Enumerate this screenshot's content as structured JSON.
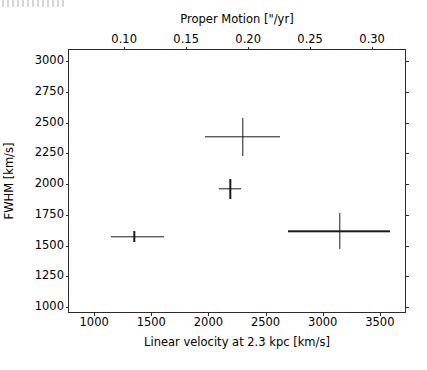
{
  "figure": {
    "width": 427,
    "height": 370,
    "background": "#ffffff",
    "foreground": "#000000",
    "marker_color": "#1a1a1a"
  },
  "chart_data": {
    "type": "scatter",
    "title": "",
    "xlabel": "Linear velocity at 2.3 kpc [km/s]",
    "ylabel": "FWHM [km/s]",
    "xlabel_top": "Proper Motion [\"/yr]",
    "grid": false,
    "legend": false,
    "xlim": [
      780,
      3720
    ],
    "ylim": [
      960,
      3090
    ],
    "xlim_top": [
      0.0555,
      0.3265
    ],
    "xticks": [
      1000,
      1500,
      2000,
      2500,
      3000,
      3500
    ],
    "xticklabels": [
      "1000",
      "1500",
      "2000",
      "2500",
      "3000",
      "3500"
    ],
    "yticks": [
      1000,
      1250,
      1500,
      1750,
      2000,
      2250,
      2500,
      2750,
      3000
    ],
    "yticklabels": [
      "1000",
      "1250",
      "1500",
      "1750",
      "2000",
      "2250",
      "2500",
      "2750",
      "3000"
    ],
    "xticks_top": [
      0.1,
      0.15,
      0.2,
      0.25,
      0.3
    ],
    "xticklabels_top": [
      "0.10",
      "0.15",
      "0.20",
      "0.25",
      "0.30"
    ],
    "points": [
      {
        "x": 1350,
        "y": 1570,
        "xerr_low": 200,
        "xerr_high": 260,
        "yerr_low": 45,
        "yerr_high": 45
      },
      {
        "x": 2300,
        "y": 2385,
        "xerr_low": 330,
        "xerr_high": 330,
        "yerr_low": 160,
        "yerr_high": 150
      },
      {
        "x": 2190,
        "y": 1960,
        "xerr_low": 95,
        "xerr_high": 95,
        "yerr_low": 80,
        "yerr_high": 80
      },
      {
        "x": 3150,
        "y": 1615,
        "xerr_low": 450,
        "xerr_high": 440,
        "yerr_low": 140,
        "yerr_high": 150
      }
    ]
  }
}
